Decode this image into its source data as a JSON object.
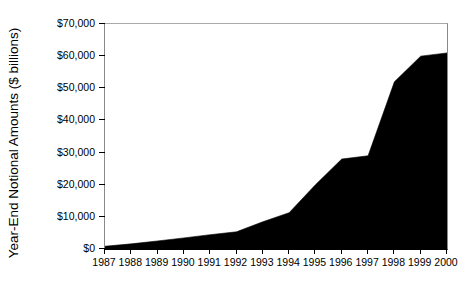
{
  "chart_data": {
    "type": "area",
    "title": "",
    "subtitle": "",
    "xlabel": "",
    "ylabel": "Year-End Notional Amounts ($ billions)",
    "categories": [
      1987,
      1988,
      1989,
      1990,
      1991,
      1992,
      1993,
      1994,
      1995,
      1996,
      1997,
      1998,
      1999,
      2000
    ],
    "x_tick_labels": [
      "1987",
      "1988",
      "1989",
      "1990",
      "1991",
      "1992",
      "1993",
      "1994",
      "1995",
      "1996",
      "1997",
      "1998",
      "1999",
      "2000"
    ],
    "values": [
      866,
      1600,
      2500,
      3450,
      4450,
      5350,
      8475,
      11300,
      20000,
      28000,
      29000,
      52000,
      60000,
      61000
    ],
    "y_tick_values": [
      0,
      10000,
      20000,
      30000,
      40000,
      50000,
      60000,
      70000
    ],
    "y_tick_labels": [
      "$0",
      "$10,000",
      "$20,000",
      "$30,000",
      "$40,000",
      "$50,000",
      "$60,000",
      "$70,000"
    ],
    "ylim": [
      0,
      70000
    ],
    "xlim": [
      1987,
      2000
    ],
    "grid": false,
    "legend": null,
    "series_color": "#000000",
    "background_color": "#ffffff",
    "axis_color": "#000000"
  }
}
